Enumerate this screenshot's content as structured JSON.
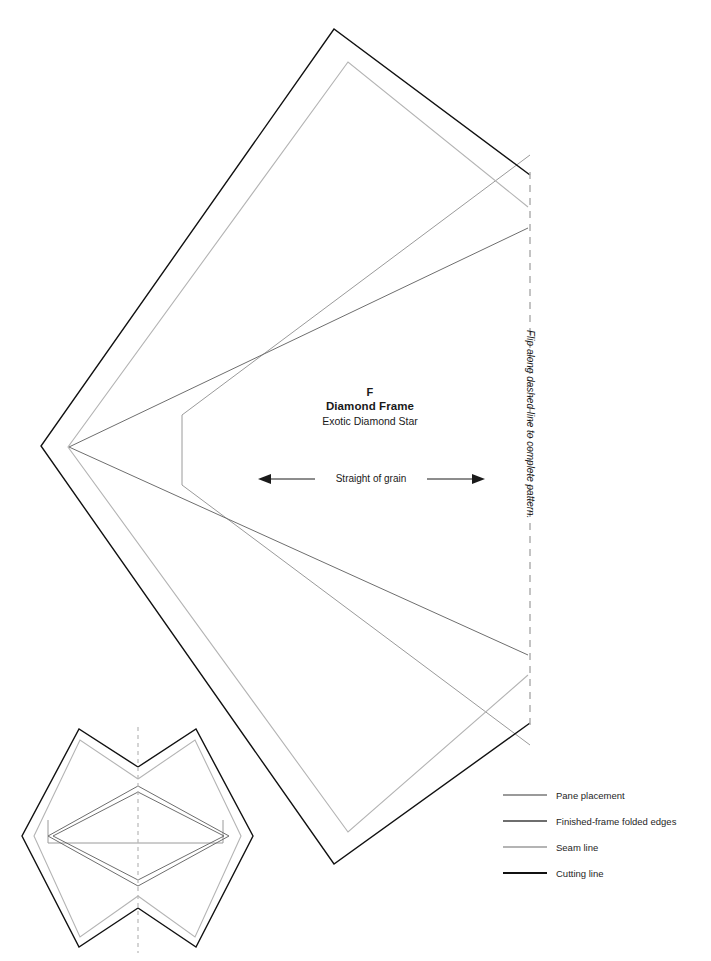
{
  "pattern": {
    "piece_letter": "F",
    "piece_name": "Diamond Frame",
    "block_name": "Exotic Diamond Star",
    "grain_label": "Straight of grain",
    "fold_note": "Flip along dashed line to complete pattern."
  },
  "legend": {
    "items": [
      {
        "label": "Pane placement",
        "color": "#9a9a9a"
      },
      {
        "label": "Finished-frame folded edges",
        "color": "#6e6e6e"
      },
      {
        "label": "Seam line",
        "color": "#b4b4b4"
      },
      {
        "label": "Cutting line",
        "color": "#111111"
      }
    ]
  },
  "colors": {
    "cutting_line": "#111111",
    "seam_line": "#b4b4b4",
    "folded_edges": "#6e6e6e",
    "pane_placement": "#9a9a9a",
    "fold_dash": "#b0b0b0",
    "arrow": "#1a1a1a"
  },
  "geometry": {
    "template": {
      "cutting_line": "334,29 530,175 530,723 334,864 41,446",
      "seam_line": "348,62 528,207 528,675 348,832 68,447",
      "folded_edges": "528,228 528,655 69,447",
      "pane_placement": "182,415 182,485 530,745 530,155"
    },
    "thumbnail": {
      "dash_axis": {
        "x": 138,
        "y1": 727,
        "y2": 953
      },
      "cut_left": "138,767 79,729 22,836 79,947 138,908",
      "cut_right": "138,767 196,729 253,836 196,947 138,908",
      "seam_left": "138,779 80,740 34,836 80,937 138,896",
      "seam_right": "138,779 195,740 241,836 195,937 138,896",
      "fold_outer": "48,836 138,786 229,836 138,886",
      "fold_inner": "52,836 138,792 224,836 138,880",
      "pane": "48,820 48,843 223,843 223,820"
    },
    "grain_arrow": {
      "x1": 258,
      "x2": 485,
      "y": 479
    }
  }
}
